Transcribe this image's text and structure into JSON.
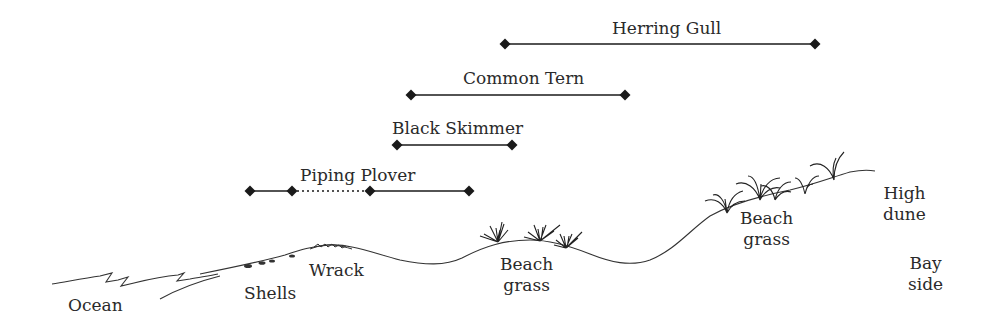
{
  "diagram": {
    "type": "beach-profile-habitat-ranges",
    "ranges": [
      {
        "species": "Herring Gull",
        "segments": [
          {
            "x1": 505,
            "x2": 815,
            "style": "solid"
          }
        ],
        "y": 44,
        "label_x": 612,
        "label_y": 18
      },
      {
        "species": "Common Tern",
        "segments": [
          {
            "x1": 411,
            "x2": 625,
            "style": "solid"
          }
        ],
        "y": 95,
        "label_x": 463,
        "label_y": 68
      },
      {
        "species": "Black Skimmer",
        "segments": [
          {
            "x1": 397,
            "x2": 512,
            "style": "solid"
          }
        ],
        "y": 145,
        "label_x": 392,
        "label_y": 118
      },
      {
        "species": "Piping Plover",
        "segments": [
          {
            "x1": 250,
            "x2": 292,
            "style": "solid"
          },
          {
            "x1": 292,
            "x2": 370,
            "style": "dotted"
          },
          {
            "x1": 370,
            "x2": 469,
            "style": "solid"
          }
        ],
        "y": 191,
        "label_x": 300,
        "label_y": 165
      }
    ],
    "zones": [
      {
        "name": "Ocean",
        "lines": [
          "Ocean"
        ],
        "x": 68,
        "y": 295
      },
      {
        "name": "Shells",
        "lines": [
          "Shells"
        ],
        "x": 244,
        "y": 283
      },
      {
        "name": "Wrack",
        "lines": [
          "Wrack"
        ],
        "x": 309,
        "y": 260
      },
      {
        "name": "Beach grass (primary dune)",
        "lines": [
          "Beach",
          "grass"
        ],
        "x": 500,
        "y": 254
      },
      {
        "name": "Beach grass (secondary dune)",
        "lines": [
          "Beach",
          "grass"
        ],
        "x": 740,
        "y": 208
      },
      {
        "name": "High dune",
        "lines": [
          "High",
          "dune"
        ],
        "x": 883,
        "y": 183
      },
      {
        "name": "Bay side",
        "lines": [
          "Bay",
          "side"
        ],
        "x": 908,
        "y": 253
      }
    ],
    "colors": {
      "line": "#1a1a1a",
      "text": "#2a2a2a",
      "background": "#ffffff"
    }
  }
}
